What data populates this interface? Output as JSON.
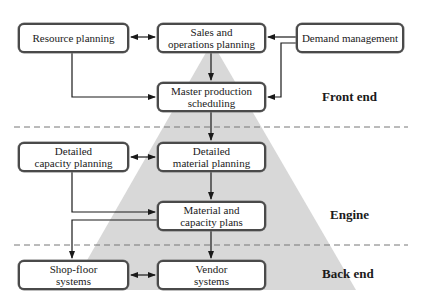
{
  "colors": {
    "triangle_fill": "#d8d8d8",
    "box_border": "#4a4a4a",
    "arrow": "#1a1a1a",
    "dashed_line": "#777777",
    "background": "#ffffff"
  },
  "sections": [
    {
      "id": "front-end",
      "label": "Front end"
    },
    {
      "id": "engine",
      "label": "Engine"
    },
    {
      "id": "back-end",
      "label": "Back end"
    }
  ],
  "boxes": {
    "resource_planning": {
      "lines": [
        "Resource planning"
      ]
    },
    "sales_operations_planning": {
      "lines": [
        "Sales and",
        "operations planning"
      ]
    },
    "demand_management": {
      "lines": [
        "Demand management"
      ]
    },
    "master_production_scheduling": {
      "lines": [
        "Master production",
        "scheduling"
      ]
    },
    "detailed_capacity_planning": {
      "lines": [
        "Detailed",
        "capacity planning"
      ]
    },
    "detailed_material_planning": {
      "lines": [
        "Detailed",
        "material planning"
      ]
    },
    "material_capacity_plans": {
      "lines": [
        "Material and",
        "capacity plans"
      ]
    },
    "shop_floor_systems": {
      "lines": [
        "Shop-floor",
        "systems"
      ]
    },
    "vendor_systems": {
      "lines": [
        "Vendor",
        "systems"
      ]
    }
  },
  "connections": [
    {
      "from": "resource_planning",
      "to": "sales_operations_planning",
      "type": "bidirectional"
    },
    {
      "from": "demand_management",
      "to": "sales_operations_planning",
      "type": "directed"
    },
    {
      "from": "demand_management",
      "to": "master_production_scheduling",
      "type": "directed"
    },
    {
      "from": "resource_planning",
      "to": "master_production_scheduling",
      "type": "directed"
    },
    {
      "from": "sales_operations_planning",
      "to": "master_production_scheduling",
      "type": "directed"
    },
    {
      "from": "master_production_scheduling",
      "to": "detailed_material_planning",
      "type": "directed"
    },
    {
      "from": "detailed_capacity_planning",
      "to": "detailed_material_planning",
      "type": "bidirectional"
    },
    {
      "from": "detailed_material_planning",
      "to": "material_capacity_plans",
      "type": "directed"
    },
    {
      "from": "detailed_capacity_planning",
      "to": "material_capacity_plans",
      "type": "directed"
    },
    {
      "from": "material_capacity_plans",
      "to": "shop_floor_systems",
      "type": "directed"
    },
    {
      "from": "material_capacity_plans",
      "to": "vendor_systems",
      "type": "directed"
    },
    {
      "from": "shop_floor_systems",
      "to": "vendor_systems",
      "type": "bidirectional"
    }
  ]
}
